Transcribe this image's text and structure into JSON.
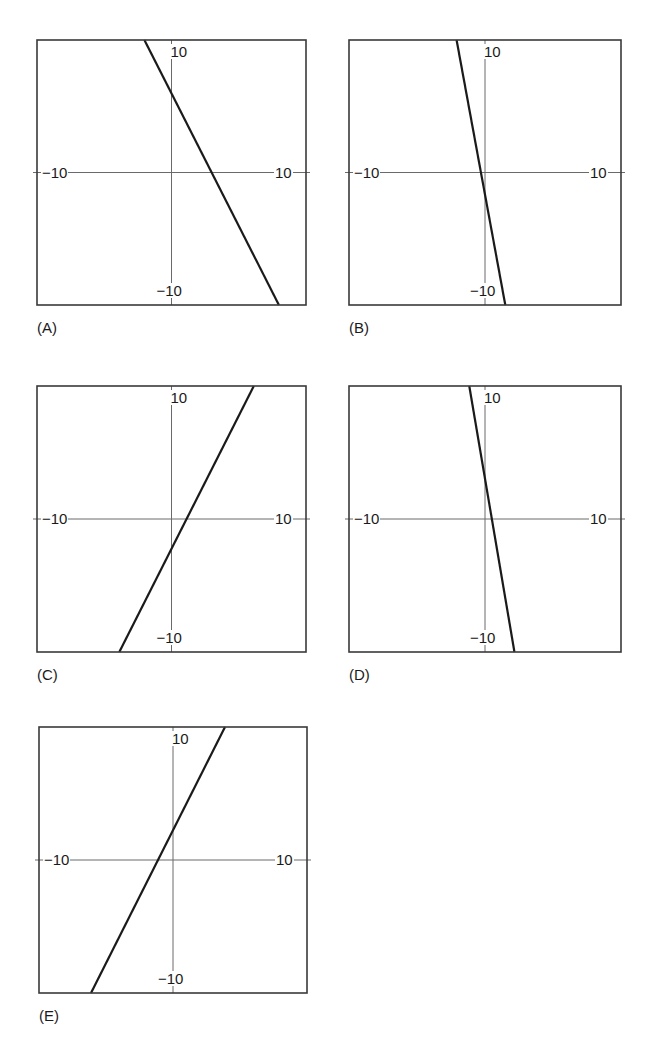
{
  "panels": [
    {
      "label": "(A)",
      "ticks": {
        "top": "10",
        "bottom": "−10",
        "left": "−10",
        "right": "10"
      }
    },
    {
      "label": "(B)",
      "ticks": {
        "top": "10",
        "bottom": "−10",
        "left": "−10",
        "right": "10"
      }
    },
    {
      "label": "(C)",
      "ticks": {
        "top": "10",
        "bottom": "−10",
        "left": "−10",
        "right": "10"
      }
    },
    {
      "label": "(D)",
      "ticks": {
        "top": "10",
        "bottom": "−10",
        "left": "−10",
        "right": "10"
      }
    },
    {
      "label": "(E)",
      "ticks": {
        "top": "10",
        "bottom": "−10",
        "left": "−10",
        "right": "10"
      }
    }
  ],
  "chart_data": [
    {
      "type": "line",
      "title": "(A)",
      "xlim": [
        -13.4,
        13.4
      ],
      "ylim": [
        -13.3,
        13.3
      ],
      "grid": false,
      "tick_labels": {
        "x": [
          "-10",
          "10"
        ],
        "y": [
          "-10",
          "10"
        ]
      },
      "series": [
        {
          "name": "line A",
          "x": [
            -2.7,
            10.7
          ],
          "y": [
            13.3,
            -13.3
          ],
          "slope": -2,
          "y_intercept": 7,
          "x_intercept": 3.5
        }
      ]
    },
    {
      "type": "line",
      "title": "(B)",
      "xlim": [
        -13.4,
        13.4
      ],
      "ylim": [
        -13.3,
        13.3
      ],
      "grid": false,
      "tick_labels": {
        "x": [
          "-10",
          "10"
        ],
        "y": [
          "-10",
          "10"
        ]
      },
      "series": [
        {
          "name": "line B",
          "x": [
            -2.8,
            2.0
          ],
          "y": [
            13.3,
            -13.3
          ],
          "slope": -6,
          "y_intercept": -2,
          "x_intercept": -0.33
        }
      ]
    },
    {
      "type": "line",
      "title": "(C)",
      "xlim": [
        -13.4,
        13.4
      ],
      "ylim": [
        -13.3,
        13.3
      ],
      "grid": false,
      "tick_labels": {
        "x": [
          "-10",
          "10"
        ],
        "y": [
          "-10",
          "10"
        ]
      },
      "series": [
        {
          "name": "line C",
          "x": [
            -5.2,
            8.2
          ],
          "y": [
            -13.3,
            13.3
          ],
          "slope": 2,
          "y_intercept": -3,
          "x_intercept": 1.5
        }
      ]
    },
    {
      "type": "line",
      "title": "(D)",
      "xlim": [
        -13.4,
        13.4
      ],
      "ylim": [
        -13.3,
        13.3
      ],
      "grid": false,
      "tick_labels": {
        "x": [
          "-10",
          "10"
        ],
        "y": [
          "-10",
          "10"
        ]
      },
      "series": [
        {
          "name": "line D",
          "x": [
            -1.55,
            2.9
          ],
          "y": [
            13.3,
            -13.3
          ],
          "slope": -6,
          "y_intercept": 4,
          "x_intercept": 0.67
        }
      ]
    },
    {
      "type": "line",
      "title": "(E)",
      "xlim": [
        -13.4,
        13.4
      ],
      "ylim": [
        -13.3,
        13.3
      ],
      "grid": false,
      "tick_labels": {
        "x": [
          "-10",
          "10"
        ],
        "y": [
          "-10",
          "10"
        ]
      },
      "series": [
        {
          "name": "line E",
          "x": [
            -8.2,
            5.2
          ],
          "y": [
            -13.3,
            13.3
          ],
          "slope": 2,
          "y_intercept": 3,
          "x_intercept": -1.5
        }
      ]
    }
  ]
}
